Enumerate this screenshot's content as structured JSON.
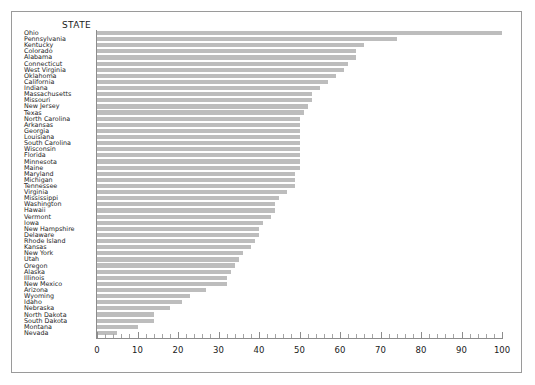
{
  "chart": {
    "type": "bar",
    "orientation": "horizontal",
    "axis_title": "STATE"
  },
  "chart_data": {
    "type": "bar",
    "title": "STATE",
    "xlabel": "",
    "ylabel": "STATE",
    "orientation": "horizontal",
    "grid": false,
    "legend": null,
    "xlim": [
      0,
      100
    ],
    "xticks": [
      0,
      10,
      20,
      30,
      40,
      50,
      60,
      70,
      80,
      90,
      100
    ],
    "minor_tick_interval": 2,
    "bar_color": "#bdbdbd",
    "categories": [
      "Ohio",
      "Pennsylvania",
      "Kentucky",
      "Colorado",
      "Alabama",
      "Connecticut",
      "West Virginia",
      "Oklahoma",
      "California",
      "Indiana",
      "Massachusetts",
      "Missouri",
      "New Jersey",
      "Texas",
      "North Carolina",
      "Arkansas",
      "Georgia",
      "Louisiana",
      "South Carolina",
      "Wisconsin",
      "Florida",
      "Minnesota",
      "Maine",
      "Maryland",
      "Michigan",
      "Tennessee",
      "Virginia",
      "Mississippi",
      "Washington",
      "Hawaii",
      "Vermont",
      "Iowa",
      "New Hampshire",
      "Delaware",
      "Rhode Island",
      "Kansas",
      "New York",
      "Utah",
      "Oregon",
      "Alaska",
      "Illinois",
      "New Mexico",
      "Arizona",
      "Wyoming",
      "Idaho",
      "Nebraska",
      "North Dakota",
      "South Dakota",
      "Montana",
      "Nevada"
    ],
    "values": [
      100,
      74,
      66,
      64,
      64,
      62,
      61,
      59,
      57,
      55,
      53,
      53,
      52,
      51,
      50,
      50,
      50,
      50,
      50,
      50,
      50,
      50,
      50,
      49,
      49,
      49,
      47,
      45,
      44,
      44,
      43,
      41,
      40,
      40,
      39,
      38,
      36,
      35,
      34,
      33,
      32,
      32,
      27,
      23,
      21,
      18,
      14,
      14,
      10,
      5
    ]
  }
}
